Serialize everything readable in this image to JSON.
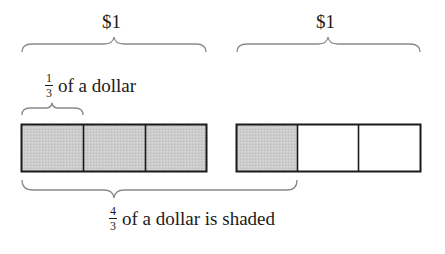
{
  "diagram": {
    "top_labels": [
      {
        "text": "$1",
        "x_center": 114
      },
      {
        "text": "$1",
        "x_center": 328
      }
    ],
    "third_label": {
      "fraction": {
        "numerator": "1",
        "denominator": "3"
      },
      "text": "of a dollar"
    },
    "shaded_label": {
      "fraction": {
        "numerator": "4",
        "denominator": "3"
      },
      "text": "of a dollar is shaded"
    },
    "bars": [
      {
        "name": "dollar-1",
        "parts": 3,
        "shaded": 3
      },
      {
        "name": "dollar-2",
        "parts": 3,
        "shaded": 1
      }
    ],
    "colors": {
      "shade": "#c8c8c8",
      "stroke": "#1a1a1a",
      "brace": "#8a8a8a",
      "background": "#ffffff"
    }
  }
}
